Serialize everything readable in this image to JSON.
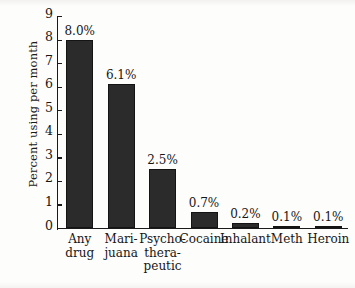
{
  "chart_data": {
    "type": "bar",
    "title": "",
    "subtitle": "",
    "xlabel": "",
    "ylabel": "Percent using per month",
    "ylim": [
      0,
      9
    ],
    "y_ticks": [
      0,
      1,
      2,
      3,
      4,
      5,
      6,
      7,
      8,
      9
    ],
    "y_tick_labels": [
      "0",
      "1",
      "2",
      "3",
      "4",
      "5",
      "6",
      "7",
      "8",
      "9"
    ],
    "grid": false,
    "legend": false,
    "legend_position": "none",
    "categories": [
      "Any drug",
      "Marijuana",
      "Psychotherapeutic",
      "Cocaine",
      "Inhalant",
      "Meth",
      "Heroin"
    ],
    "category_label_lines": [
      [
        "Any",
        "drug"
      ],
      [
        "Mari-",
        "juana"
      ],
      [
        "Psycho-",
        "thera-",
        "peutic"
      ],
      [
        "Cocaine"
      ],
      [
        "Inhalant"
      ],
      [
        "Meth"
      ],
      [
        "Heroin"
      ]
    ],
    "values": [
      8.0,
      6.1,
      2.5,
      0.7,
      0.2,
      0.1,
      0.1
    ],
    "value_labels": [
      "8.0%",
      "6.1%",
      "2.5%",
      "0.7%",
      "0.2%",
      "0.1%",
      "0.1%"
    ],
    "bar_color": "#2b2b2b",
    "axis_color": "#1a1a1a",
    "background_color": "#fdfdfc"
  }
}
